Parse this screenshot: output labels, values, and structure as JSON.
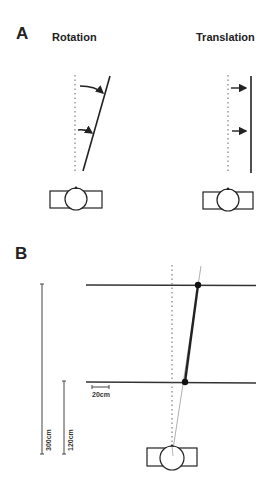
{
  "panel_a": {
    "label": "A",
    "rotation_title": "Rotation",
    "translation_title": "Translation"
  },
  "panel_b": {
    "label": "B",
    "scale_300": "300cm",
    "scale_120": "120cm",
    "scale_20": "20cm"
  },
  "colors": {
    "line": "#2a2a2a",
    "thin": "#888888",
    "dotted": "#666666"
  }
}
